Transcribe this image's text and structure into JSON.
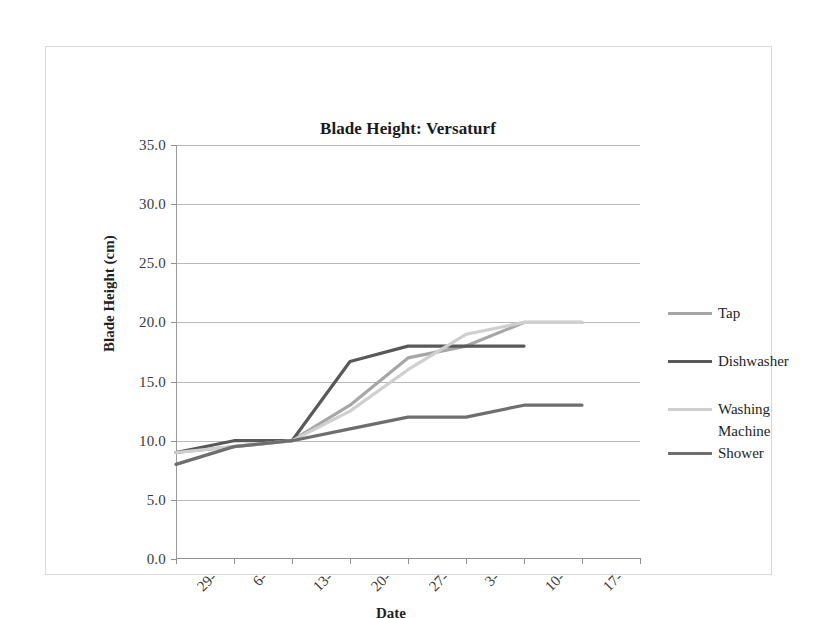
{
  "chart_data": {
    "type": "line",
    "title": "Blade Height: Versaturf",
    "xlabel": "Date",
    "ylabel": "Blade Height (cm)",
    "categories": [
      "29-",
      "6-",
      "13-",
      "20-",
      "27-",
      "3-",
      "10-",
      "17-"
    ],
    "yticks": [
      "0.0",
      "5.0",
      "10.0",
      "15.0",
      "20.0",
      "25.0",
      "30.0",
      "35.0"
    ],
    "ylim": [
      0,
      35
    ],
    "ytick_step": 5,
    "grid": true,
    "legend_position": "right",
    "series": [
      {
        "name": "Tap",
        "color": "#a6a6a6",
        "values": [
          9.0,
          9.5,
          10.0,
          13.0,
          17.0,
          18.0,
          20.0,
          20.0
        ]
      },
      {
        "name": "Dishwasher",
        "color": "#595959",
        "values": [
          9.0,
          10.0,
          10.0,
          16.7,
          18.0,
          18.0,
          18.0,
          null
        ]
      },
      {
        "name": "Washing Machine",
        "color": "#cfcfcf",
        "values": [
          9.0,
          9.5,
          10.0,
          12.5,
          16.0,
          19.0,
          20.0,
          20.0
        ]
      },
      {
        "name": "Shower",
        "color": "#6e6e6e",
        "values": [
          8.0,
          9.5,
          10.0,
          11.0,
          12.0,
          12.0,
          13.0,
          13.0
        ]
      }
    ]
  },
  "legend": {
    "entries": [
      {
        "label": "Tap"
      },
      {
        "label": "Dishwasher"
      },
      {
        "label": "Washing"
      },
      {
        "label": "Machine"
      },
      {
        "label": "Shower"
      }
    ]
  }
}
